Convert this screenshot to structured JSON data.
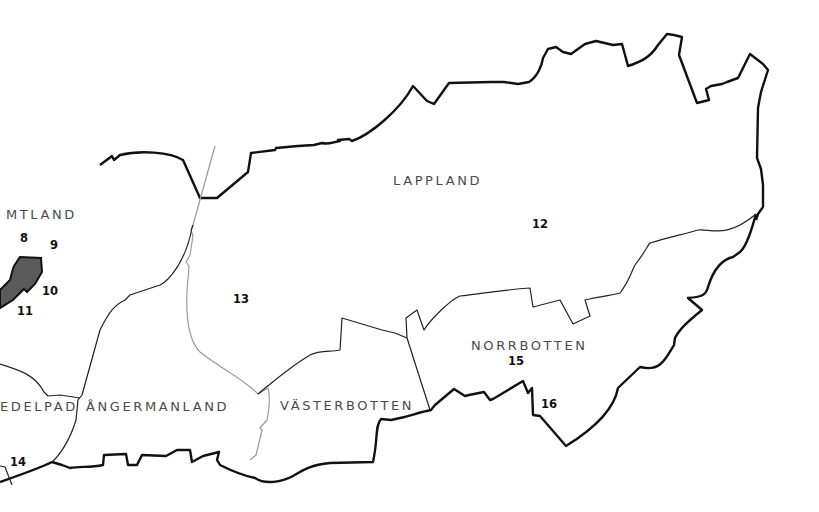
{
  "map": {
    "colors": {
      "outer_border": "#111111",
      "inner_border": "#222222",
      "lappland_border": "#999999",
      "highlight_fill": "#5a5a5a",
      "label_text": "#4a4a4a"
    },
    "regions": [
      {
        "name": "MTLAND",
        "id": "jamtland"
      },
      {
        "name": "LAPPLAND",
        "id": "lappland"
      },
      {
        "name": "EDELPAD",
        "id": "medelpad"
      },
      {
        "name": "ÅNGERMANLAND",
        "id": "angermanland"
      },
      {
        "name": "VÄSTERBOTTEN",
        "id": "vasterbotten"
      },
      {
        "name": "NORRBOTTEN",
        "id": "norrbotten"
      }
    ],
    "numbers": [
      "8",
      "9",
      "10",
      "11",
      "12",
      "13",
      "14",
      "15",
      "16"
    ]
  }
}
